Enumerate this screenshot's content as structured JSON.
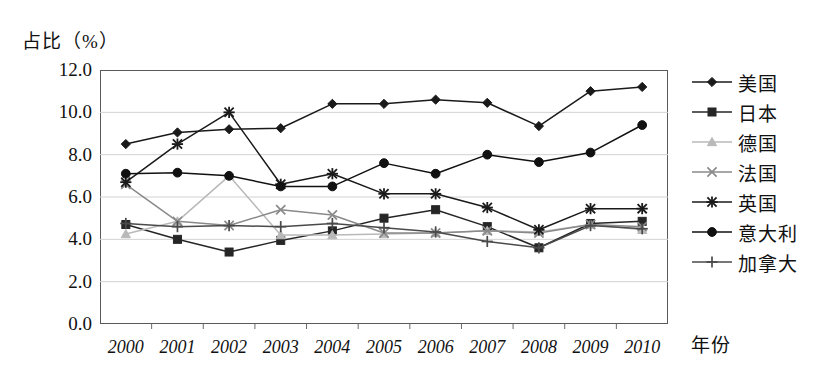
{
  "axis": {
    "y_title": "占比（%）",
    "x_title": "年份",
    "y_ticks": [
      "0.0",
      "2.0",
      "4.0",
      "6.0",
      "8.0",
      "10.0",
      "12.0"
    ]
  },
  "chart_data": {
    "type": "line",
    "title": "",
    "xlabel": "年份",
    "ylabel": "占比（%）",
    "ylim": [
      0.0,
      12.0
    ],
    "ytick_step": 2.0,
    "grid": true,
    "legend_position": "right",
    "categories": [
      "2000",
      "2001",
      "2002",
      "2003",
      "2004",
      "2005",
      "2006",
      "2007",
      "2008",
      "2009",
      "2010"
    ],
    "series": [
      {
        "name": "美国",
        "marker": "diamond",
        "color": "#1a1a1a",
        "values": [
          8.5,
          9.05,
          9.2,
          9.25,
          10.4,
          10.4,
          10.6,
          10.45,
          9.35,
          11.0,
          11.2
        ]
      },
      {
        "name": "日本",
        "marker": "square",
        "color": "#262626",
        "values": [
          4.7,
          4.0,
          3.4,
          3.95,
          4.4,
          5.0,
          5.4,
          4.6,
          3.6,
          4.75,
          4.85
        ]
      },
      {
        "name": "德国",
        "marker": "triangle",
        "color": "#b9b9b9",
        "values": [
          4.25,
          4.85,
          7.0,
          4.2,
          4.2,
          4.25,
          4.3,
          4.4,
          4.35,
          4.7,
          4.45
        ]
      },
      {
        "name": "法国",
        "marker": "cross",
        "color": "#8a8a8a",
        "values": [
          6.6,
          4.85,
          4.65,
          5.4,
          5.15,
          4.3,
          4.3,
          4.4,
          4.3,
          4.7,
          4.6
        ]
      },
      {
        "name": "英国",
        "marker": "star",
        "color": "#1a1a1a",
        "values": [
          6.7,
          8.5,
          10.0,
          6.6,
          7.1,
          6.15,
          6.15,
          5.5,
          4.45,
          5.45,
          5.45
        ]
      },
      {
        "name": "意大利",
        "marker": "circle",
        "color": "#111111",
        "values": [
          7.1,
          7.15,
          7.0,
          6.5,
          6.5,
          7.6,
          7.1,
          8.0,
          7.65,
          8.1,
          9.4
        ]
      },
      {
        "name": "加拿大",
        "marker": "plus",
        "color": "#4a4a4a",
        "values": [
          4.75,
          4.6,
          4.65,
          4.6,
          4.75,
          4.55,
          4.35,
          3.9,
          3.6,
          4.65,
          4.5
        ]
      }
    ]
  }
}
